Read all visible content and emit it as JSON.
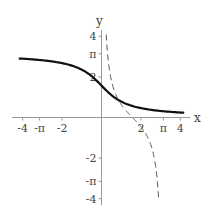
{
  "chart_data": {
    "type": "line",
    "title": "",
    "xlabel": "x",
    "ylabel": "y",
    "xlim": [
      -4.2,
      4.2
    ],
    "ylim": [
      -4.2,
      4.3
    ],
    "grid": false,
    "legend": null,
    "x_ticks": [
      {
        "value": -4,
        "label": "-4"
      },
      {
        "value": -3.14159,
        "label": "-π"
      },
      {
        "value": -2,
        "label": "-2"
      },
      {
        "value": 2,
        "label": "2"
      },
      {
        "value": 3.14159,
        "label": "π"
      },
      {
        "value": 4,
        "label": "4"
      }
    ],
    "y_ticks": [
      {
        "value": 4,
        "label": "4"
      },
      {
        "value": 3.14159,
        "label": "π"
      },
      {
        "value": 2,
        "label": "2"
      },
      {
        "value": -2,
        "label": "-2"
      },
      {
        "value": -3.14159,
        "label": "-π"
      },
      {
        "value": -4,
        "label": "-4"
      }
    ],
    "series": [
      {
        "name": "arccot(x)",
        "style": "solid",
        "color": "#111111",
        "x": [
          -4.2,
          -3,
          -2,
          -1,
          -0.5,
          0,
          0.5,
          1,
          2,
          3,
          4.2
        ],
        "y": [
          2.91,
          2.82,
          2.68,
          2.36,
          2.03,
          1.571,
          1.107,
          0.785,
          0.464,
          0.322,
          0.233
        ]
      },
      {
        "name": "cot(x)",
        "style": "dashed",
        "color": "#555555",
        "domain": [
          0.24,
          2.9
        ],
        "x": [
          0.24,
          0.5,
          0.785,
          1.0,
          1.571,
          2.0,
          2.356,
          2.6,
          2.9
        ],
        "y": [
          4.1,
          1.83,
          1.0,
          0.642,
          0.0,
          -0.458,
          -1.0,
          -1.67,
          -4.0
        ]
      }
    ]
  }
}
